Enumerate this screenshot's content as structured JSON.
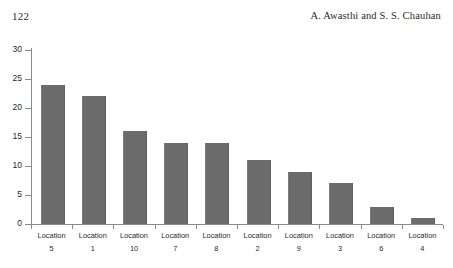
{
  "page": {
    "number": "122",
    "running_head": "A. Awasthi and S. S. Chauhan"
  },
  "chart_data": {
    "type": "bar",
    "title": "",
    "subtitle": "",
    "xlabel": "",
    "ylabel": "",
    "categories": [
      "Location 5",
      "Location 1",
      "Location 10",
      "Location 7",
      "Location 8",
      "Location 2",
      "Location 9",
      "Location 3",
      "Location 6",
      "Location 4"
    ],
    "category_names": [
      "Location",
      "Location",
      "Location",
      "Location",
      "Location",
      "Location",
      "Location",
      "Location",
      "Location",
      "Location"
    ],
    "category_numbers": [
      "5",
      "1",
      "10",
      "7",
      "8",
      "2",
      "9",
      "3",
      "6",
      "4"
    ],
    "values": [
      24,
      22,
      16,
      14,
      14,
      11,
      9,
      7,
      3,
      1
    ],
    "ylim": [
      0,
      30
    ],
    "yticks": [
      0,
      5,
      10,
      15,
      20,
      25,
      30
    ],
    "ytick_labels": [
      "0",
      "5",
      "10",
      "15",
      "20",
      "25",
      "30"
    ],
    "grid": false,
    "legend": false,
    "legend_position": "none",
    "bar_color": "#6b6b6b",
    "axis_color": "#8a8a8a",
    "background": "#ffffff"
  }
}
